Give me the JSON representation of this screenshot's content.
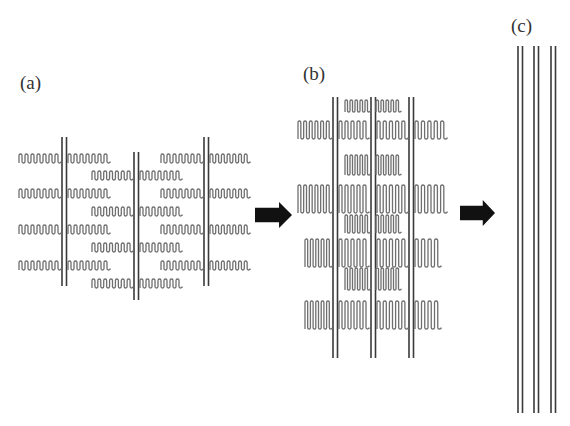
{
  "figure": {
    "panels": [
      {
        "id": "a",
        "label": "(a)",
        "label_pos": [
          20,
          89
        ],
        "rods": [
          {
            "x": 62,
            "y1": 137,
            "y2": 286
          },
          {
            "x": 134,
            "y1": 152,
            "y2": 300
          },
          {
            "x": 204,
            "y1": 137,
            "y2": 286
          }
        ],
        "rod_gap": 4.5,
        "serpentines": [
          {
            "x": 19,
            "y": 154,
            "w": 42,
            "h": 9,
            "loops": 7
          },
          {
            "x": 68,
            "y": 154,
            "w": 42,
            "h": 9,
            "loops": 7
          },
          {
            "x": 161,
            "y": 154,
            "w": 42,
            "h": 9,
            "loops": 7
          },
          {
            "x": 210,
            "y": 154,
            "w": 40,
            "h": 9,
            "loops": 7
          },
          {
            "x": 92,
            "y": 171,
            "w": 41,
            "h": 9,
            "loops": 7
          },
          {
            "x": 140,
            "y": 171,
            "w": 42,
            "h": 9,
            "loops": 7
          },
          {
            "x": 19,
            "y": 189,
            "w": 42,
            "h": 9,
            "loops": 7
          },
          {
            "x": 68,
            "y": 189,
            "w": 42,
            "h": 9,
            "loops": 7
          },
          {
            "x": 161,
            "y": 189,
            "w": 42,
            "h": 9,
            "loops": 7
          },
          {
            "x": 210,
            "y": 189,
            "w": 40,
            "h": 9,
            "loops": 7
          },
          {
            "x": 92,
            "y": 207,
            "w": 41,
            "h": 9,
            "loops": 7
          },
          {
            "x": 140,
            "y": 207,
            "w": 42,
            "h": 9,
            "loops": 7
          },
          {
            "x": 19,
            "y": 225,
            "w": 42,
            "h": 9,
            "loops": 7
          },
          {
            "x": 68,
            "y": 225,
            "w": 42,
            "h": 9,
            "loops": 7
          },
          {
            "x": 161,
            "y": 225,
            "w": 42,
            "h": 9,
            "loops": 7
          },
          {
            "x": 210,
            "y": 225,
            "w": 40,
            "h": 9,
            "loops": 7
          },
          {
            "x": 92,
            "y": 243,
            "w": 41,
            "h": 9,
            "loops": 7
          },
          {
            "x": 140,
            "y": 243,
            "w": 42,
            "h": 9,
            "loops": 7
          },
          {
            "x": 19,
            "y": 261,
            "w": 42,
            "h": 9,
            "loops": 7
          },
          {
            "x": 68,
            "y": 261,
            "w": 42,
            "h": 9,
            "loops": 7
          },
          {
            "x": 161,
            "y": 261,
            "w": 42,
            "h": 9,
            "loops": 7
          },
          {
            "x": 210,
            "y": 261,
            "w": 40,
            "h": 9,
            "loops": 7
          },
          {
            "x": 92,
            "y": 279,
            "w": 41,
            "h": 9,
            "loops": 7
          },
          {
            "x": 140,
            "y": 279,
            "w": 42,
            "h": 9,
            "loops": 7
          }
        ]
      },
      {
        "id": "b",
        "label": "(b)",
        "label_pos": [
          303,
          80
        ],
        "rods": [
          {
            "x": 333,
            "y1": 97,
            "y2": 358
          },
          {
            "x": 371,
            "y1": 97,
            "y2": 358
          },
          {
            "x": 409,
            "y1": 97,
            "y2": 358
          }
        ],
        "rod_gap": 4.5,
        "serpentines": [
          {
            "x": 298,
            "y": 121,
            "w": 34,
            "h": 18,
            "loops": 6
          },
          {
            "x": 339,
            "y": 121,
            "w": 30,
            "h": 18,
            "loops": 5
          },
          {
            "x": 377,
            "y": 121,
            "w": 31,
            "h": 18,
            "loops": 5
          },
          {
            "x": 415,
            "y": 121,
            "w": 32,
            "h": 18,
            "loops": 5
          },
          {
            "x": 345,
            "y": 100,
            "w": 25,
            "h": 12,
            "loops": 5
          },
          {
            "x": 376,
            "y": 100,
            "w": 25,
            "h": 12,
            "loops": 5
          },
          {
            "x": 345,
            "y": 155,
            "w": 25,
            "h": 20,
            "loops": 5
          },
          {
            "x": 376,
            "y": 155,
            "w": 25,
            "h": 20,
            "loops": 5
          },
          {
            "x": 298,
            "y": 185,
            "w": 34,
            "h": 28,
            "loops": 6
          },
          {
            "x": 339,
            "y": 185,
            "w": 30,
            "h": 28,
            "loops": 5
          },
          {
            "x": 377,
            "y": 185,
            "w": 31,
            "h": 28,
            "loops": 5
          },
          {
            "x": 415,
            "y": 185,
            "w": 32,
            "h": 28,
            "loops": 5
          },
          {
            "x": 345,
            "y": 215,
            "w": 25,
            "h": 18,
            "loops": 5
          },
          {
            "x": 376,
            "y": 215,
            "w": 25,
            "h": 18,
            "loops": 5
          },
          {
            "x": 305,
            "y": 239,
            "w": 27,
            "h": 28,
            "loops": 5
          },
          {
            "x": 339,
            "y": 239,
            "w": 30,
            "h": 28,
            "loops": 5
          },
          {
            "x": 377,
            "y": 239,
            "w": 31,
            "h": 28,
            "loops": 5
          },
          {
            "x": 415,
            "y": 239,
            "w": 26,
            "h": 28,
            "loops": 4
          },
          {
            "x": 345,
            "y": 268,
            "w": 25,
            "h": 22,
            "loops": 5
          },
          {
            "x": 376,
            "y": 268,
            "w": 25,
            "h": 22,
            "loops": 5
          },
          {
            "x": 305,
            "y": 301,
            "w": 27,
            "h": 28,
            "loops": 5
          },
          {
            "x": 339,
            "y": 301,
            "w": 30,
            "h": 28,
            "loops": 5
          },
          {
            "x": 377,
            "y": 301,
            "w": 31,
            "h": 28,
            "loops": 5
          },
          {
            "x": 415,
            "y": 301,
            "w": 26,
            "h": 28,
            "loops": 4
          }
        ]
      },
      {
        "id": "c",
        "label": "(c)",
        "label_pos": [
          511,
          32
        ],
        "rods": [
          {
            "x": 518,
            "y1": 46,
            "y2": 413
          },
          {
            "x": 534,
            "y1": 46,
            "y2": 413
          },
          {
            "x": 551,
            "y1": 46,
            "y2": 413
          }
        ],
        "rod_gap": 4.5,
        "serpentines": []
      }
    ],
    "arrows": [
      {
        "name": "arrow-a-to-b",
        "x": 255,
        "y": 215,
        "len": 37,
        "h": 26
      },
      {
        "name": "arrow-b-to-c",
        "x": 460,
        "y": 213,
        "len": 35,
        "h": 26
      }
    ],
    "colors": {
      "rod": "#3a3a3a",
      "serpentine": "#6f6f6f",
      "arrow": "#111111",
      "label": "#333333"
    }
  }
}
